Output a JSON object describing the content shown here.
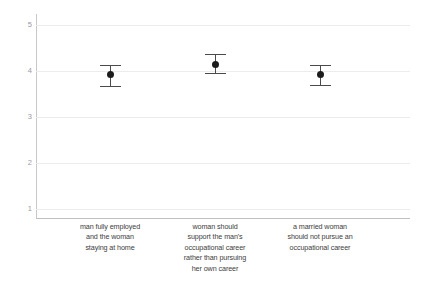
{
  "chart_data": {
    "type": "scatter",
    "title": "",
    "subtitle": "",
    "xlabel": "",
    "ylabel": "",
    "ylim": [
      1,
      5
    ],
    "yticks": [
      1,
      2,
      3,
      4,
      5
    ],
    "ytick_labels": [
      "1",
      "2",
      "3",
      "4",
      "5"
    ],
    "grid": true,
    "legend": "none",
    "error_bars": "vertical with caps",
    "categories": [
      "man fully employed and the woman staying at home",
      "woman should support the man's occupational career rather than pursuing her own career",
      "a married woman should not pursue an occupational career"
    ],
    "category_lines": [
      [
        "man fully employed",
        "and the woman",
        "staying at home"
      ],
      [
        "woman should",
        "support the man's",
        "occupational career",
        "rather than pursuing",
        "her own career"
      ],
      [
        "a married woman",
        "should not pursue an",
        "occupational career"
      ]
    ],
    "values": [
      3.93,
      4.15,
      3.93
    ],
    "error_low": [
      3.67,
      3.95,
      3.7
    ],
    "error_high": [
      4.14,
      4.37,
      4.13
    ],
    "series": [
      {
        "name": "mean with confidence interval",
        "values": [
          3.93,
          4.15,
          3.93
        ],
        "error_low": [
          3.67,
          3.95,
          3.7
        ],
        "error_high": [
          4.14,
          4.37,
          4.13
        ]
      }
    ],
    "colors": {
      "marker": "#1c1c1c",
      "whisker": "#4a4a4a",
      "gridline": "#ececed",
      "axis": "#c8c8cc",
      "tick_label": "#9a9a9e",
      "category_label": "#3d3d3d",
      "background": "#ffffff"
    }
  }
}
